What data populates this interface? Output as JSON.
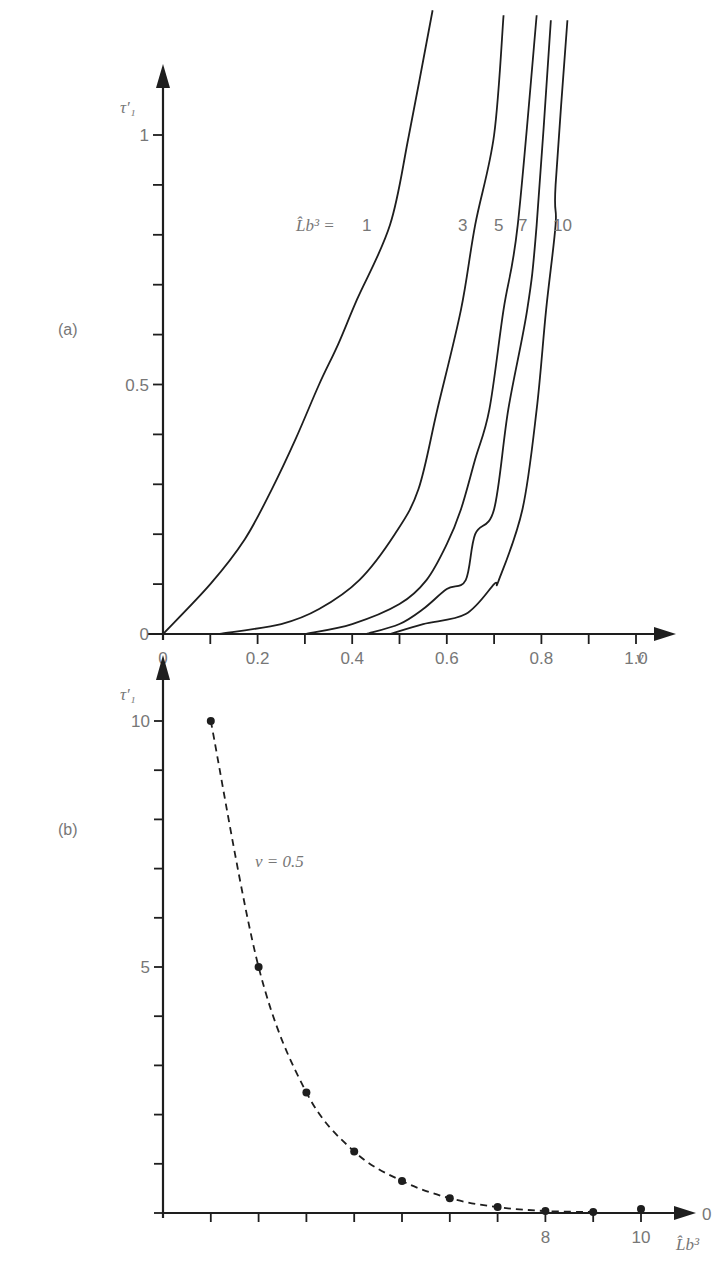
{
  "chart_data": [
    {
      "panel_label": "(a)",
      "type": "line",
      "xlabel": "ν",
      "ylabel": "τ′₁",
      "xlim": [
        0,
        1.0
      ],
      "ylim": [
        0,
        1.0
      ],
      "x_ticks": [
        0,
        0.1,
        0.2,
        0.3,
        0.4,
        0.5,
        0.6,
        0.7,
        0.8,
        0.9,
        1.0
      ],
      "x_tick_labels": [
        "0",
        "",
        "0.2",
        "",
        "0.4",
        "",
        "0.6",
        "",
        "0.8",
        "",
        "1.0"
      ],
      "y_ticks": [
        0,
        0.1,
        0.2,
        0.3,
        0.4,
        0.5,
        0.6,
        0.7,
        0.8,
        0.9,
        1.0
      ],
      "y_tick_labels": [
        "0",
        "",
        "",
        "",
        "",
        "0.5",
        "",
        "",
        "",
        "",
        "1"
      ],
      "legend_prefix": "L̂b³ =",
      "grid": false,
      "series": [
        {
          "name": "1",
          "x": [
            0,
            0.1,
            0.173,
            0.23,
            0.28,
            0.33,
            0.37,
            0.41,
            0.48,
            0.52,
            0.57
          ],
          "y": [
            0,
            0.1,
            0.19,
            0.29,
            0.39,
            0.5,
            0.58,
            0.67,
            0.82,
            1.0,
            1.25
          ]
        },
        {
          "name": "3",
          "x": [
            0.12,
            0.25,
            0.33,
            0.415,
            0.49,
            0.54,
            0.58,
            0.63,
            0.66,
            0.7,
            0.72
          ],
          "y": [
            0,
            0.02,
            0.05,
            0.108,
            0.2,
            0.29,
            0.45,
            0.65,
            0.82,
            1.0,
            1.24
          ]
        },
        {
          "name": "5",
          "x": [
            0.3,
            0.4,
            0.5,
            0.557,
            0.6,
            0.63,
            0.66,
            0.69,
            0.72,
            0.75,
            0.79
          ],
          "y": [
            0,
            0.02,
            0.06,
            0.108,
            0.18,
            0.25,
            0.35,
            0.45,
            0.65,
            0.82,
            1.24
          ]
        },
        {
          "name": "7",
          "x": [
            0.43,
            0.5,
            0.55,
            0.6,
            0.64,
            0.66,
            0.7,
            0.73,
            0.77,
            0.79,
            0.82
          ],
          "y": [
            0,
            0.02,
            0.05,
            0.09,
            0.108,
            0.2,
            0.25,
            0.45,
            0.65,
            0.82,
            1.23
          ]
        },
        {
          "name": "10",
          "x": [
            0.48,
            0.55,
            0.64,
            0.7,
            0.71,
            0.76,
            0.79,
            0.81,
            0.83,
            0.83,
            0.855
          ],
          "y": [
            0,
            0.02,
            0.04,
            0.1,
            0.108,
            0.25,
            0.45,
            0.65,
            0.82,
            0.9,
            1.23
          ]
        }
      ]
    },
    {
      "panel_label": "(b)",
      "type": "scatter",
      "xlabel": "L̂b³",
      "ylabel": "τ′₁",
      "xlim": [
        0,
        10.5
      ],
      "ylim": [
        0,
        10
      ],
      "x_ticks": [
        0,
        1,
        2,
        3,
        4,
        5,
        6,
        7,
        8,
        9,
        10
      ],
      "x_tick_labels": [
        "",
        "",
        "",
        "",
        "",
        "",
        "",
        "",
        "8",
        "",
        "10"
      ],
      "x_axis_end_label": "0",
      "y_ticks": [
        0,
        1,
        2,
        3,
        4,
        5,
        6,
        7,
        8,
        9,
        10
      ],
      "y_tick_labels": [
        "",
        "",
        "",
        "",
        "",
        "5",
        "",
        "",
        "",
        "",
        "10"
      ],
      "annotation": "ν = 0.5",
      "grid": false,
      "series": [
        {
          "name": "ν = 0.5",
          "line_style": "dashed",
          "x": [
            1,
            2,
            3,
            4,
            5,
            6,
            7,
            8,
            9,
            10
          ],
          "y": [
            10,
            5,
            2.45,
            1.25,
            0.65,
            0.3,
            0.12,
            0.04,
            0.02,
            0.08
          ],
          "connected_count": 9
        }
      ]
    }
  ]
}
